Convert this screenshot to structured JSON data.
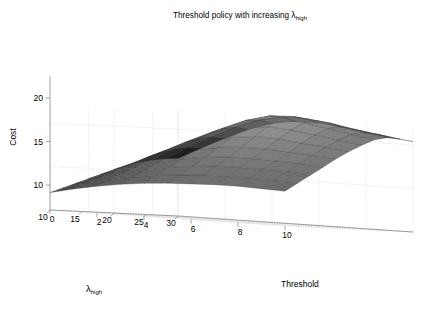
{
  "figure": {
    "title_main": "Threshold policy with increasing ",
    "title_lambda": "λ",
    "title_sub": "high",
    "background": "#ffffff"
  },
  "axes": {
    "z": {
      "label": "Cost",
      "ticks": [
        "20",
        "15",
        "10"
      ],
      "tick_values": [
        20,
        15,
        10
      ],
      "range": [
        8,
        23
      ]
    },
    "x_left": {
      "label_lambda": "λ",
      "label_sub": "high",
      "ticks": [
        "30",
        "25",
        "20",
        "15",
        "10"
      ],
      "tick_values": [
        30,
        25,
        20,
        15,
        10
      ],
      "range": [
        10,
        30
      ]
    },
    "y_right": {
      "label": "Threshold",
      "ticks": [
        "0",
        "2",
        "4",
        "6",
        "8",
        "10"
      ],
      "tick_values": [
        0,
        2,
        4,
        6,
        8,
        10
      ],
      "range": [
        0,
        10
      ]
    }
  },
  "chart_data": {
    "type": "surface",
    "xlabel": "Threshold",
    "ylabel": "λ_high",
    "zlabel": "Cost",
    "xlim": [
      0,
      10
    ],
    "ylim": [
      10,
      30
    ],
    "zlim": [
      8,
      23
    ],
    "grid": true,
    "colormap": "gray",
    "shading": "faceted",
    "x": [
      0,
      1,
      2,
      3,
      4,
      5,
      6,
      7,
      8,
      9,
      10
    ],
    "y": [
      10,
      12,
      14,
      16,
      18,
      20,
      22,
      24,
      26,
      28,
      30
    ],
    "z_note": "Cost surface rows indexed by lambda_high (10..30), columns by Threshold (0..10)",
    "z": [
      [
        12.0,
        12.6,
        13.1,
        13.5,
        13.8,
        14.0,
        14.1,
        14.2,
        14.2,
        14.1,
        14.0
      ],
      [
        12.6,
        13.3,
        13.9,
        14.4,
        14.8,
        15.0,
        15.2,
        15.2,
        15.2,
        15.1,
        15.0
      ],
      [
        13.2,
        14.0,
        14.7,
        15.3,
        15.8,
        16.1,
        16.3,
        16.3,
        16.3,
        16.2,
        16.0
      ],
      [
        13.8,
        14.7,
        15.5,
        16.2,
        16.8,
        17.2,
        17.4,
        17.4,
        17.3,
        17.2,
        17.0
      ],
      [
        14.4,
        15.4,
        16.3,
        17.1,
        17.9,
        18.4,
        18.6,
        18.6,
        18.4,
        18.2,
        18.0
      ],
      [
        15.0,
        16.1,
        17.2,
        18.1,
        19.0,
        19.6,
        19.9,
        19.8,
        19.5,
        19.2,
        18.9
      ],
      [
        15.5,
        16.8,
        18.0,
        19.0,
        20.0,
        20.8,
        21.1,
        20.9,
        20.5,
        20.1,
        19.7
      ],
      [
        16.0,
        17.4,
        18.7,
        19.9,
        21.0,
        21.8,
        22.1,
        21.8,
        21.3,
        20.8,
        20.4
      ],
      [
        16.3,
        17.8,
        19.2,
        20.5,
        21.6,
        22.3,
        22.4,
        22.1,
        21.6,
        21.1,
        20.7
      ],
      [
        16.5,
        18.0,
        19.4,
        20.7,
        21.7,
        22.2,
        22.2,
        21.9,
        21.4,
        21.0,
        20.6
      ],
      [
        16.6,
        18.0,
        19.3,
        20.5,
        21.4,
        21.8,
        21.8,
        21.5,
        21.1,
        20.7,
        20.4
      ]
    ]
  },
  "projection": {
    "corner_origin": [
      178,
      216
    ],
    "corner_left": [
      50,
      210
    ],
    "corner_right": [
      413,
      232
    ],
    "corner_back": [
      287,
      55
    ],
    "z_axis_top": [
      50,
      55
    ]
  }
}
